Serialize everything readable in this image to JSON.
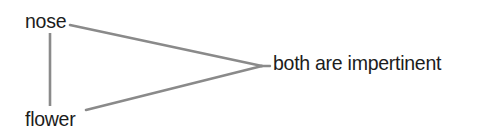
{
  "diagram": {
    "title": "both are impertinent",
    "background_color": "#ffffff",
    "line_color": "#8a8a8a",
    "text_color": "#1c1c1c",
    "nodes": [
      {
        "id": "nose",
        "label": "nose"
      },
      {
        "id": "flower",
        "label": "flower"
      },
      {
        "id": "conclusion",
        "label": "both are impertinent"
      }
    ],
    "edges": [
      {
        "from": "nose",
        "to": "flower",
        "kind": "vertical-connector"
      },
      {
        "from": "nose",
        "to": "conclusion",
        "kind": "diagonal-connector"
      },
      {
        "from": "flower",
        "to": "conclusion",
        "kind": "diagonal-connector"
      }
    ]
  }
}
